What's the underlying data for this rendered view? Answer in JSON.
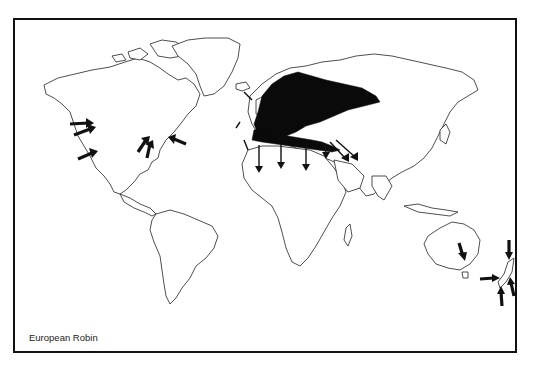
{
  "map": {
    "caption": "European Robin",
    "subject": "European Robin distribution and introductions",
    "projection": "world outline",
    "colors": {
      "frame": "#111111",
      "land_outline": "#222222",
      "native_range": "#0a0a0a",
      "background": "#ffffff"
    },
    "legend": [],
    "regions": {
      "native_range": "Europe, western Russia/Siberia, North Africa coast, Near East",
      "migration_arrows": "Southward arrows from Europe into North Africa and Middle East",
      "introduction_arrows": [
        "Western North America (British Columbia / Pacific coast)",
        "Eastern North America (Great Lakes / New York)",
        "Southeastern Australia (Victoria)",
        "New Zealand"
      ]
    }
  }
}
